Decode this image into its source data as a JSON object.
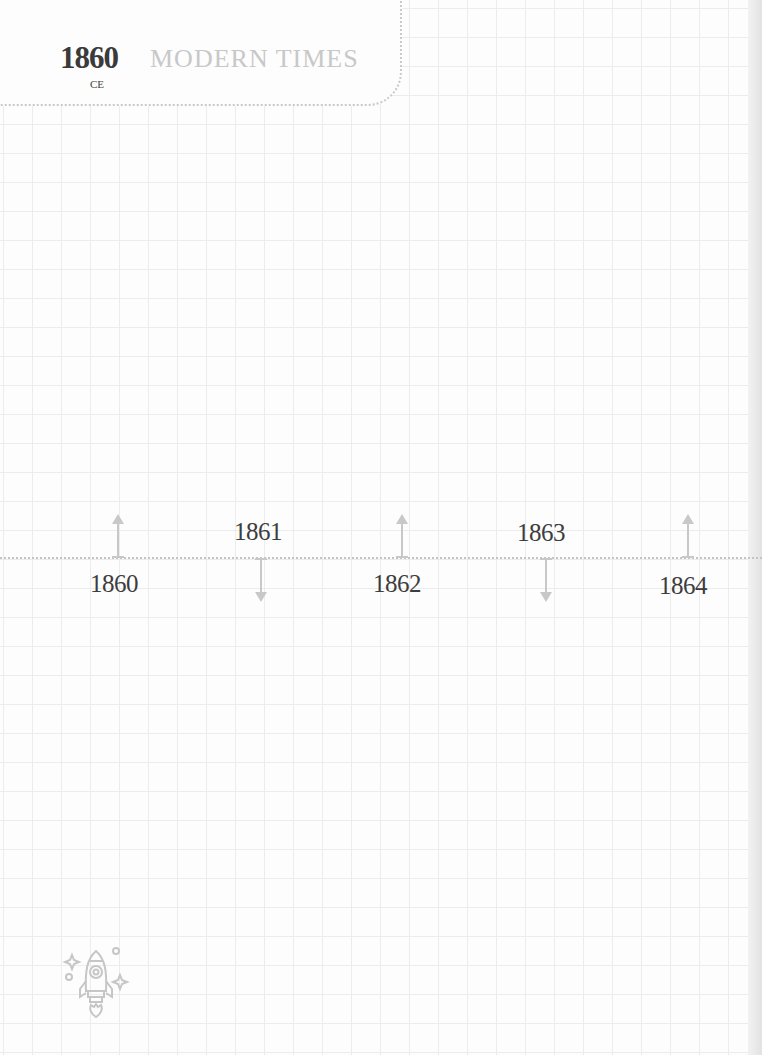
{
  "header": {
    "year": "1860",
    "era": "CE",
    "title": "MODERN TIMES"
  },
  "timeline": {
    "events": [
      {
        "year": "1860",
        "direction": "up",
        "label_position": "below"
      },
      {
        "year": "1861",
        "direction": "down",
        "label_position": "above"
      },
      {
        "year": "1862",
        "direction": "up",
        "label_position": "below"
      },
      {
        "year": "1863",
        "direction": "down",
        "label_position": "above"
      },
      {
        "year": "1864",
        "direction": "up",
        "label_position": "below"
      }
    ]
  },
  "decorations": {
    "footer_icon": "rocket-icon"
  },
  "colors": {
    "grid": "#ececec",
    "year_text": "#3a3a3a",
    "title_text": "#c8c8c8",
    "axis": "#c4c4c4"
  }
}
